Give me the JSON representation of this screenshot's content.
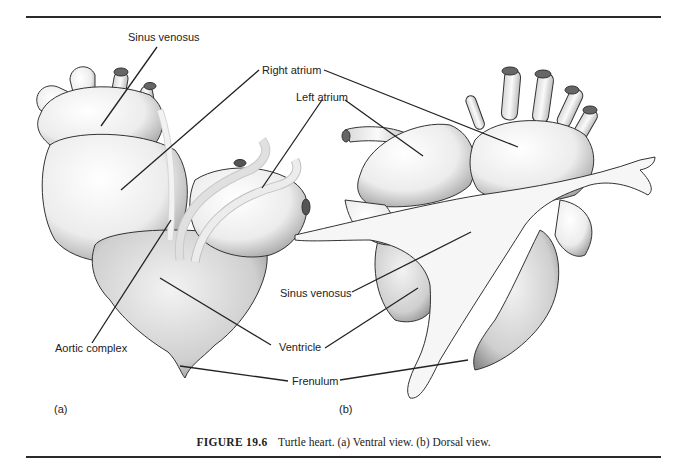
{
  "figure": {
    "number": "FIGURE 19.6",
    "caption": "Turtle heart. (a) Ventral view. (b) Dorsal view.",
    "panels": {
      "a": "(a)",
      "b": "(b)"
    },
    "labels": {
      "sinus_venosus_a": "Sinus venosus",
      "right_atrium": "Right atrium",
      "left_atrium": "Left atrium",
      "sinus_venosus_b": "Sinus venosus",
      "aortic_complex": "Aortic complex",
      "ventricle": "Ventricle",
      "frenulum": "Frenulum"
    }
  }
}
